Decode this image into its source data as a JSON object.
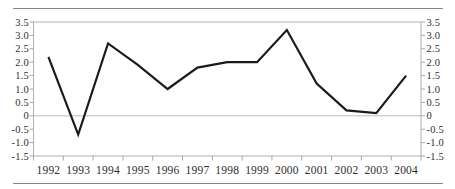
{
  "chart_data": {
    "type": "line",
    "title": "",
    "xlabel": "",
    "ylabel": "",
    "categories": [
      "1992",
      "1993",
      "1994",
      "1995",
      "1996",
      "1997",
      "1998",
      "1999",
      "2000",
      "2001",
      "2002",
      "2003",
      "2004"
    ],
    "series": [
      {
        "name": "main-line",
        "values": [
          2.2,
          -0.7,
          2.7,
          1.9,
          1.0,
          1.8,
          2.0,
          2.0,
          3.2,
          1.2,
          0.2,
          0.1,
          1.5
        ]
      }
    ],
    "ylim": [
      -1.5,
      3.5
    ],
    "ytick_interval": 0.5,
    "ytick_labels": [
      "3.5",
      "3.0",
      "2.5",
      "2.0",
      "1.5",
      "1.0",
      "0.5",
      "0",
      "-0.5",
      "-1.0",
      "-1.5"
    ],
    "y_axis_sides": "both",
    "grid": "zero-line-only",
    "legend_position": "none",
    "colors": {
      "line": "#1b1b1b",
      "frame": "#b0b0b0",
      "zero_line": "#bdbdbd",
      "tick": "#a8a8a8",
      "label": "#2e2e2e",
      "rule": "#858585",
      "background": "#ffffff"
    }
  }
}
